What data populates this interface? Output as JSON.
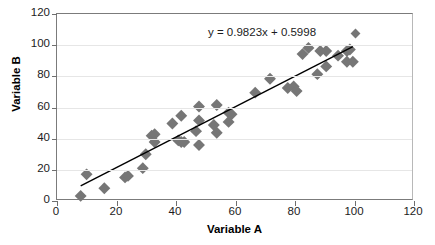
{
  "chart_data": {
    "type": "scatter",
    "title": "",
    "xlabel": "Variable A",
    "ylabel": "Variable B",
    "xlim": [
      0,
      120
    ],
    "ylim": [
      0,
      120
    ],
    "xticks": [
      0,
      20,
      40,
      60,
      80,
      100,
      120
    ],
    "yticks": [
      0,
      20,
      40,
      60,
      80,
      100,
      120
    ],
    "grid": "horizontal",
    "legend": "none",
    "marker": {
      "shape": "diamond",
      "color": "#767676",
      "size": 6
    },
    "annotation": {
      "text": "y = 0.9823x + 0.5998",
      "marker_color": "#767676"
    },
    "trendline": {
      "type": "linear",
      "slope": 0.9823,
      "intercept": 0.5998,
      "color": "#000000",
      "x_start": 8,
      "x_end": 100
    },
    "points": [
      {
        "x": 8,
        "y": 2
      },
      {
        "x": 10,
        "y": 16
      },
      {
        "x": 16,
        "y": 7
      },
      {
        "x": 23,
        "y": 14
      },
      {
        "x": 24,
        "y": 15
      },
      {
        "x": 29,
        "y": 20
      },
      {
        "x": 30,
        "y": 29
      },
      {
        "x": 32,
        "y": 41
      },
      {
        "x": 33,
        "y": 42
      },
      {
        "x": 33,
        "y": 37
      },
      {
        "x": 39,
        "y": 49
      },
      {
        "x": 41,
        "y": 38
      },
      {
        "x": 42,
        "y": 37
      },
      {
        "x": 42,
        "y": 54
      },
      {
        "x": 43,
        "y": 37
      },
      {
        "x": 47,
        "y": 44
      },
      {
        "x": 48,
        "y": 60
      },
      {
        "x": 48,
        "y": 51
      },
      {
        "x": 48,
        "y": 35
      },
      {
        "x": 53,
        "y": 48
      },
      {
        "x": 54,
        "y": 61
      },
      {
        "x": 54,
        "y": 43
      },
      {
        "x": 58,
        "y": 56
      },
      {
        "x": 58,
        "y": 50
      },
      {
        "x": 59,
        "y": 55
      },
      {
        "x": 67,
        "y": 69
      },
      {
        "x": 72,
        "y": 78
      },
      {
        "x": 78,
        "y": 72
      },
      {
        "x": 80,
        "y": 73
      },
      {
        "x": 81,
        "y": 70
      },
      {
        "x": 83,
        "y": 94
      },
      {
        "x": 85,
        "y": 98
      },
      {
        "x": 88,
        "y": 81
      },
      {
        "x": 89,
        "y": 96
      },
      {
        "x": 91,
        "y": 96
      },
      {
        "x": 91,
        "y": 86
      },
      {
        "x": 95,
        "y": 93
      },
      {
        "x": 98,
        "y": 96
      },
      {
        "x": 98,
        "y": 89
      },
      {
        "x": 99,
        "y": 97
      },
      {
        "x": 100,
        "y": 89
      }
    ]
  }
}
